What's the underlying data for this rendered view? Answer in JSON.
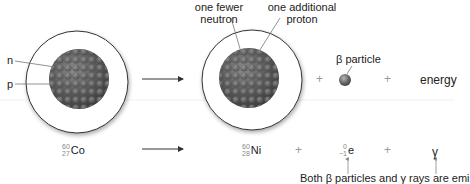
{
  "diagram": {
    "title_hidden": "",
    "top_row": {
      "cobalt_nucleus_labels": {
        "neutron_label": "n",
        "proton_label": "p"
      },
      "nickel_nucleus_labels": {
        "fewer_neutron_line1": "one fewer",
        "fewer_neutron_line2": "neutron",
        "additional_proton_line1": "one additional",
        "additional_proton_line2": "proton"
      },
      "beta_label": "β particle",
      "plus_1": "+",
      "plus_2": "+",
      "energy_label": "energy"
    },
    "bottom_row": {
      "reactant": {
        "mass": "60",
        "atomic": "27",
        "symbol": "Co"
      },
      "product": {
        "mass": "60",
        "atomic": "28",
        "symbol": "Ni"
      },
      "plus_1": "+",
      "electron": {
        "mass": "0",
        "atomic": "−1",
        "symbol": "e"
      },
      "plus_2": "+",
      "gamma": "γ"
    },
    "note": "Both β particles and γ rays are emi"
  },
  "colors": {
    "nucleus": "#5a5a5a",
    "circle_stroke": "#333333",
    "arrow": "#333333",
    "leader_line": "#777777"
  }
}
